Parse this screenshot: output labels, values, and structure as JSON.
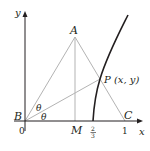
{
  "figure": {
    "axes": {
      "x_label": "x",
      "y_label": "y",
      "origin_label": "0"
    },
    "points": {
      "A": "A",
      "B": "B",
      "C": "C",
      "M": "M",
      "P": "P (x, y)"
    },
    "angles": {
      "upper": "θ",
      "lower": "θ"
    },
    "ticks": {
      "two_thirds_num": "2",
      "two_thirds_den": "3",
      "one": "1"
    },
    "colors": {
      "triangle": "#b3b3b3",
      "curve": "#231f20",
      "axes": "#231f20"
    }
  }
}
